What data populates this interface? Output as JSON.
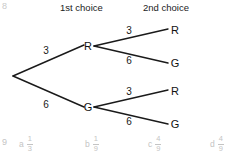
{
  "question_number_top": "8",
  "question_number_bottom": "9",
  "headers": {
    "first_choice": "1st choice",
    "second_choice": "2nd choice"
  },
  "tree": {
    "root": {
      "label": "",
      "x": 13,
      "y": 76
    },
    "level1": [
      {
        "id": "r",
        "label": "R",
        "weight": "3",
        "x": 88,
        "y": 46,
        "weight_x": 46,
        "weight_y": 50
      },
      {
        "id": "g",
        "label": "G",
        "weight": "6",
        "x": 88,
        "y": 107,
        "weight_x": 46,
        "weight_y": 104
      }
    ],
    "level2": [
      {
        "parent": "r",
        "label": "R",
        "weight": "3",
        "x": 172,
        "y": 30,
        "weight_x": 128,
        "weight_y": 30
      },
      {
        "parent": "r",
        "label": "G",
        "weight": "6",
        "x": 172,
        "y": 63,
        "weight_x": 128,
        "weight_y": 60
      },
      {
        "parent": "g",
        "label": "R",
        "weight": "3",
        "x": 172,
        "y": 91,
        "weight_x": 128,
        "weight_y": 91
      },
      {
        "parent": "g",
        "label": "G",
        "weight": "6",
        "x": 172,
        "y": 124,
        "weight_x": 128,
        "weight_y": 121
      }
    ]
  },
  "answers": [
    {
      "letter": "a",
      "numerator": "1",
      "denominator": "3"
    },
    {
      "letter": "b",
      "numerator": "1",
      "denominator": "9"
    },
    {
      "letter": "c",
      "numerator": "4",
      "denominator": "9"
    },
    {
      "letter": "d",
      "numerator": "4",
      "denominator": "9"
    }
  ],
  "colors": {
    "ink": "#1a1a1a",
    "faded": "#c4c4c4",
    "background": "#ffffff"
  }
}
